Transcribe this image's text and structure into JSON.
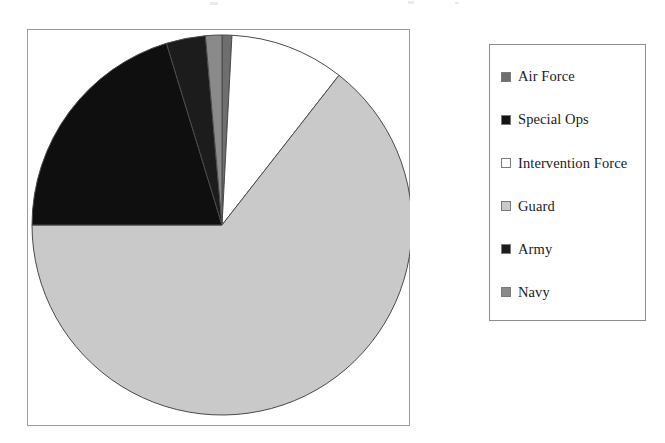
{
  "chart_data": {
    "type": "pie",
    "title": "",
    "xlabel": "",
    "ylabel": "",
    "legend_position": "right",
    "grid": false,
    "start_angle_deg": 0,
    "direction": "clockwise",
    "categories": [
      "Air Force",
      "Special Ops",
      "Intervention Force",
      "Guard",
      "Army",
      "Navy"
    ],
    "values": [
      0.8,
      20.3,
      9.7,
      64.4,
      3.4,
      1.4
    ],
    "slices": [
      {
        "label": "Air Force",
        "value": 0.8,
        "angle_deg": 3,
        "color": "#6e6e6e",
        "order": 1
      },
      {
        "label": "Intervention Force",
        "value": 9.7,
        "angle_deg": 35,
        "color": "#ffffff",
        "order": 2
      },
      {
        "label": "Guard",
        "value": 64.4,
        "angle_deg": 232,
        "color": "#c9c9c9",
        "order": 3
      },
      {
        "label": "Special Ops",
        "value": 20.3,
        "angle_deg": 73,
        "color": "#0f0f0f",
        "order": 4
      },
      {
        "label": "Army",
        "value": 3.4,
        "angle_deg": 12,
        "color": "#1c1c1c",
        "order": 5
      },
      {
        "label": "Navy",
        "value": 1.4,
        "angle_deg": 5,
        "color": "#8a8a8a",
        "order": 6
      }
    ]
  },
  "legend": {
    "items": [
      {
        "label": "Air Force",
        "swatch_color": "#6e6e6e"
      },
      {
        "label": "Special Ops",
        "swatch_color": "#141414"
      },
      {
        "label": "Intervention Force",
        "swatch_color": "#ffffff"
      },
      {
        "label": "Guard",
        "swatch_color": "#c9c9c9"
      },
      {
        "label": "Army",
        "swatch_color": "#1c1c1c"
      },
      {
        "label": "Navy",
        "swatch_color": "#8a8a8a"
      }
    ]
  },
  "style": {
    "plot_border_color": "#9a9a9a",
    "legend_border_color": "#8d8d8d",
    "slice_outline_color": "#4a4a4a",
    "background": "#ffffff"
  }
}
